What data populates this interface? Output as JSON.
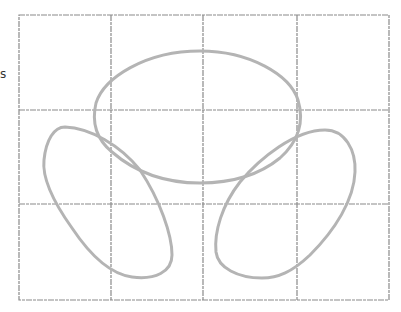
{
  "diagram": {
    "stray_text": "s",
    "grid": {
      "x_lines": [
        19,
        111,
        203,
        297,
        389
      ],
      "y_lines": [
        15,
        110,
        204,
        300
      ],
      "columns": 4,
      "rows": 3,
      "color": "#8a8a8a"
    },
    "shapes": [
      {
        "name": "top-loop",
        "type": "ellipse",
        "cx": 197,
        "cy": 117,
        "rx": 103,
        "ry": 66,
        "color": "#b4b4b4"
      },
      {
        "name": "left-loop",
        "type": "tilted-ellipse",
        "color": "#b4b4b4"
      },
      {
        "name": "right-loop",
        "type": "tilted-ellipse",
        "color": "#b4b4b4"
      }
    ]
  }
}
